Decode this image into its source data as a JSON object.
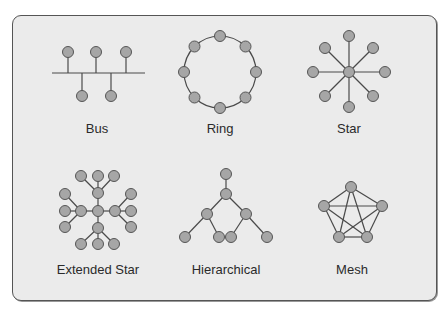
{
  "diagram": {
    "colors": {
      "background": "#ebebeb",
      "border": "#555555",
      "node_fill": "#a6a6a6",
      "node_stroke": "#555555",
      "edge": "#4a4a4a",
      "label": "#2a2a2a"
    },
    "topologies": [
      {
        "name": "Bus",
        "label": "Bus"
      },
      {
        "name": "Ring",
        "label": "Ring"
      },
      {
        "name": "Star",
        "label": "Star"
      },
      {
        "name": "Extended Star",
        "label": "Extended Star"
      },
      {
        "name": "Hierarchical",
        "label": "Hierarchical"
      },
      {
        "name": "Mesh",
        "label": "Mesh"
      }
    ]
  }
}
